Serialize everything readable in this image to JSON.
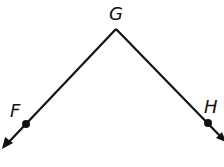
{
  "diagram": {
    "type": "angle",
    "name": "angle FGH",
    "vertex": {
      "label": "G",
      "x": 116,
      "y": 29
    },
    "points": [
      {
        "label": "F",
        "x": 26,
        "y": 124
      },
      {
        "label": "H",
        "x": 208,
        "y": 123
      }
    ],
    "rays": [
      {
        "from": "G",
        "through": "F",
        "end": {
          "x": 3,
          "y": 148
        }
      },
      {
        "from": "G",
        "through": "H",
        "end": {
          "x": 226,
          "y": 141
        }
      }
    ],
    "colors": {
      "stroke": "#111111",
      "background": "#ffffff"
    }
  }
}
